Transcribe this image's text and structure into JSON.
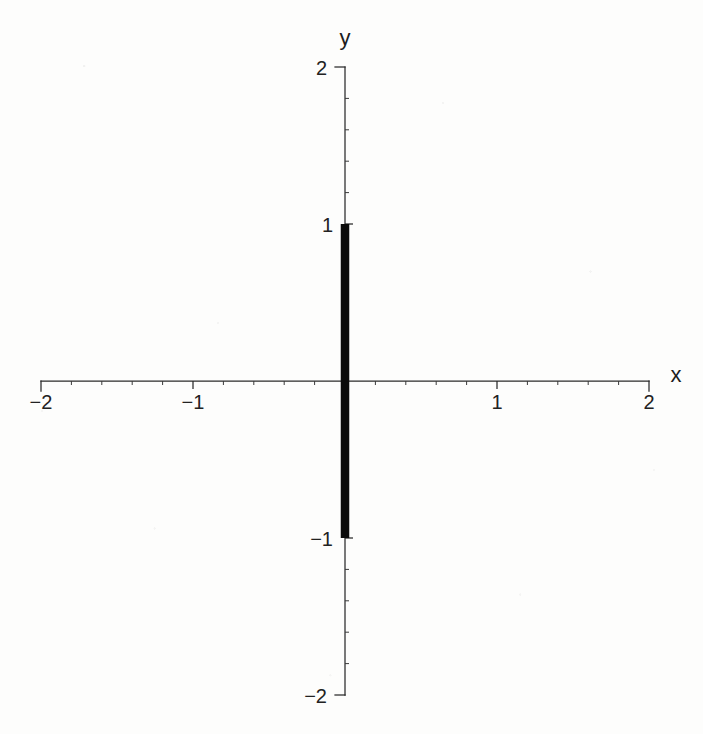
{
  "chart_data": {
    "type": "line",
    "title": "",
    "subtitle": "",
    "xlabel": "x",
    "ylabel": "y",
    "xlim": [
      -2,
      2
    ],
    "ylim": [
      -2,
      2
    ],
    "grid": false,
    "legend": null,
    "legend_position": "none",
    "x_ticks": [
      -2,
      -1,
      0,
      1,
      2
    ],
    "y_ticks": [
      -2,
      -1,
      0,
      1,
      2
    ],
    "x_tick_labels": [
      "−2",
      "−1",
      "",
      "1",
      "2"
    ],
    "y_tick_labels": [
      "−2",
      "−1",
      "",
      "1",
      "2"
    ],
    "minor_tick_step": 0.2,
    "series": [
      {
        "name": "vertical segment at x = 0",
        "type": "segment",
        "color": "#0b0b0b",
        "linewidth_px": 8.5,
        "x": [
          0,
          0
        ],
        "y": [
          -1,
          1
        ],
        "points": [
          {
            "x": 0,
            "y": -1
          },
          {
            "x": 0,
            "y": 1
          }
        ]
      }
    ],
    "annotations": []
  },
  "axes": {
    "x_axis_label": "x",
    "y_axis_label": "y",
    "x_tick_labels": [
      {
        "value": -2,
        "text": "−2"
      },
      {
        "value": -1,
        "text": "−1"
      },
      {
        "value": 1,
        "text": "1"
      },
      {
        "value": 2,
        "text": "2"
      }
    ],
    "y_tick_labels": [
      {
        "value": 2,
        "text": "2"
      },
      {
        "value": 1,
        "text": "1"
      },
      {
        "value": -1,
        "text": "−1"
      },
      {
        "value": -2,
        "text": "−2"
      }
    ]
  },
  "colors": {
    "background": "#fdfdfc",
    "axis": "#2a2a2a",
    "data": "#0b0b0b",
    "text": "#222222"
  }
}
